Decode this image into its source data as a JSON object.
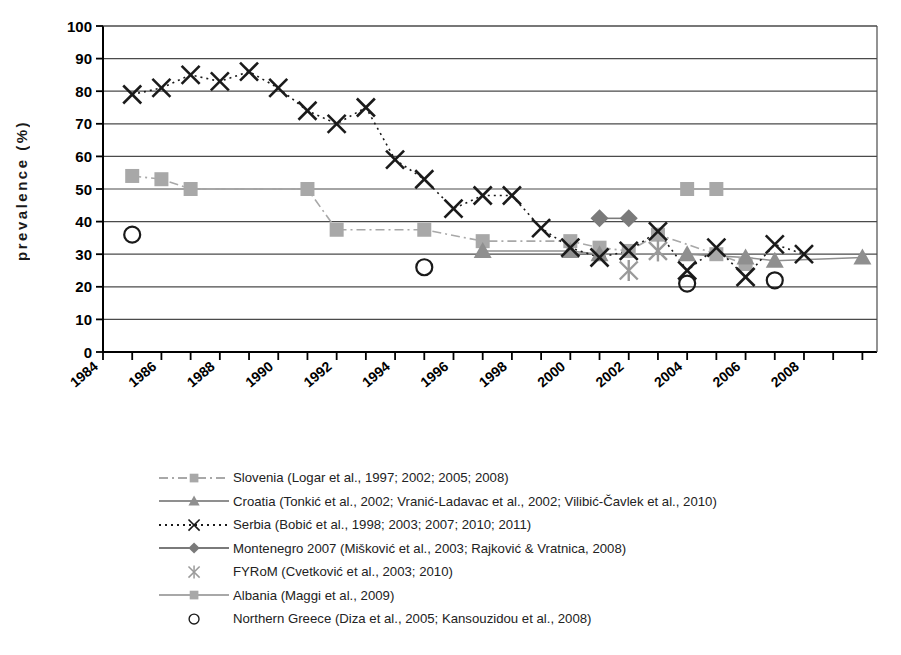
{
  "chart_data": {
    "type": "scatter",
    "title": "",
    "xlabel": "",
    "ylabel": "prevalence (%)",
    "ylim": [
      0,
      100
    ],
    "ytick_step": 10,
    "yticks": [
      0,
      10,
      20,
      30,
      40,
      50,
      60,
      70,
      80,
      90,
      100
    ],
    "xlim": [
      1984,
      2010.5
    ],
    "xticks": [
      1984,
      1985,
      1986,
      1987,
      1988,
      1989,
      1990,
      1991,
      1992,
      1993,
      1994,
      1995,
      1996,
      1997,
      1998,
      1999,
      2000,
      2001,
      2002,
      2003,
      2004,
      2005,
      2006,
      2007,
      2008,
      2009,
      2010
    ],
    "xtick_labels": [
      "1984",
      "1986",
      "1988",
      "1990",
      "1992",
      "1994",
      "1996",
      "1998",
      "2000",
      "2002",
      "2004",
      "2006",
      "2008"
    ],
    "xtick_label_years": [
      1984,
      1986,
      1988,
      1990,
      1992,
      1994,
      1996,
      1998,
      2000,
      2002,
      2004,
      2006,
      2008
    ],
    "grid": "horizontal",
    "legend_position": "below",
    "series": [
      {
        "name": "Slovenia",
        "legend_label": "Slovenia (Logar et al., 1997; 2002; 2005; 2008)",
        "marker": "square",
        "line": "dash-dot",
        "color": "#a8a8a8",
        "points": [
          {
            "x": 1985,
            "y": 54
          },
          {
            "x": 1986,
            "y": 53
          },
          {
            "x": 1987,
            "y": 50
          },
          {
            "x": 1991,
            "y": 50
          },
          {
            "x": 1992,
            "y": 37.5
          },
          {
            "x": 1995,
            "y": 37.5
          },
          {
            "x": 1997,
            "y": 34
          },
          {
            "x": 2000,
            "y": 34
          },
          {
            "x": 2001,
            "y": 32
          },
          {
            "x": 2002,
            "y": 31
          },
          {
            "x": 2003,
            "y": 36
          },
          {
            "x": 2005,
            "y": 30
          },
          {
            "x": 2006,
            "y": 27
          }
        ]
      },
      {
        "name": "Croatia",
        "legend_label": "Croatia (Tonkić et al., 2002; Vranić-Ladavac et al., 2002; Vilibić-Čavlek et al., 2010)",
        "marker": "triangle",
        "line": "solid",
        "color": "#8f8f8f",
        "points": [
          {
            "x": 1997,
            "y": 31
          },
          {
            "x": 2000,
            "y": 31
          },
          {
            "x": 2001,
            "y": 30
          },
          {
            "x": 2004,
            "y": 30
          },
          {
            "x": 2006,
            "y": 29
          },
          {
            "x": 2007,
            "y": 28
          },
          {
            "x": 2010,
            "y": 29
          }
        ]
      },
      {
        "name": "Serbia",
        "legend_label": "Serbia (Bobić et al., 1998; 2003; 2007; 2010; 2011)",
        "marker": "x",
        "line": "dotted",
        "color": "#1a1a1a",
        "points": [
          {
            "x": 1985,
            "y": 79
          },
          {
            "x": 1986,
            "y": 81
          },
          {
            "x": 1987,
            "y": 85
          },
          {
            "x": 1988,
            "y": 83
          },
          {
            "x": 1989,
            "y": 86
          },
          {
            "x": 1990,
            "y": 81
          },
          {
            "x": 1991,
            "y": 74
          },
          {
            "x": 1992,
            "y": 70
          },
          {
            "x": 1993,
            "y": 75
          },
          {
            "x": 1994,
            "y": 59
          },
          {
            "x": 1995,
            "y": 53
          },
          {
            "x": 1996,
            "y": 44
          },
          {
            "x": 1997,
            "y": 48
          },
          {
            "x": 1998,
            "y": 48
          },
          {
            "x": 1999,
            "y": 38
          },
          {
            "x": 2000,
            "y": 32
          },
          {
            "x": 2001,
            "y": 29
          },
          {
            "x": 2002,
            "y": 31
          },
          {
            "x": 2003,
            "y": 37
          },
          {
            "x": 2004,
            "y": 25
          },
          {
            "x": 2005,
            "y": 32
          },
          {
            "x": 2006,
            "y": 23
          },
          {
            "x": 2007,
            "y": 33
          },
          {
            "x": 2008,
            "y": 30
          }
        ]
      },
      {
        "name": "Montenegro 2007",
        "legend_label": "Montenegro 2007 (Mišković et al., 2003; Rajković & Vratnica, 2008)",
        "marker": "diamond",
        "line": "solid",
        "color": "#7a7a7a",
        "points": [
          {
            "x": 2001,
            "y": 41
          },
          {
            "x": 2002,
            "y": 41
          }
        ]
      },
      {
        "name": "FYRoM",
        "legend_label": "FYRoM (Cvetković et al., 2003; 2010)",
        "marker": "asterisk",
        "line": "none",
        "color": "#9a9a9a",
        "points": [
          {
            "x": 2002,
            "y": 25
          },
          {
            "x": 2003,
            "y": 31
          }
        ]
      },
      {
        "name": "Albania",
        "legend_label": "Albania (Maggi et al., 2009)",
        "marker": "square",
        "line": "solid",
        "color": "#a8a8a8",
        "points": [
          {
            "x": 2004,
            "y": 50
          },
          {
            "x": 2005,
            "y": 50
          }
        ]
      },
      {
        "name": "Northern Greece",
        "legend_label": "Northern Greece (Diza et al., 2005; Kansouzidou et al., 2008)",
        "marker": "circle",
        "line": "none",
        "color": "#1a1a1a",
        "points": [
          {
            "x": 1985,
            "y": 36
          },
          {
            "x": 1995,
            "y": 26
          },
          {
            "x": 2004,
            "y": 21
          },
          {
            "x": 2007,
            "y": 22
          }
        ]
      }
    ]
  }
}
